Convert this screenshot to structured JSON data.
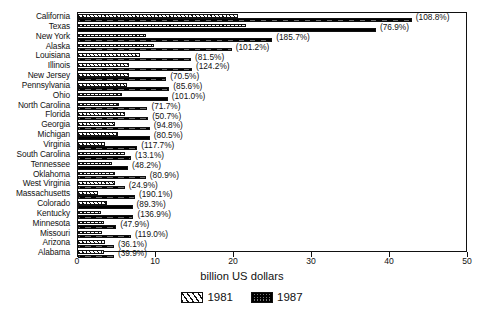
{
  "chart_data": {
    "type": "bar",
    "orientation": "horizontal",
    "title": "",
    "xlabel": "billion US dollars",
    "ylabel": "",
    "xlim": [
      0,
      50
    ],
    "xticks": [
      0,
      10,
      20,
      30,
      40,
      50
    ],
    "xtick_labels": [
      "0",
      "10",
      "20",
      "30",
      "40",
      "50"
    ],
    "grid": false,
    "legend_position": "bottom-center",
    "categories": [
      "California",
      "Texas",
      "New York",
      "Alaska",
      "Louisiana",
      "Illinois",
      "New Jersey",
      "Pennsylvania",
      "Ohio",
      "North Carolina",
      "Florida",
      "Georgia",
      "Michigan",
      "Virginia",
      "South Carolina",
      "Tennessee",
      "Oklahoma",
      "West Virginia",
      "Massachusetts",
      "Colorado",
      "Kentucky",
      "Minnesota",
      "Missouri",
      "Arizona",
      "Alabama"
    ],
    "series": [
      {
        "name": "1981",
        "values": [
          20.5,
          21.6,
          8.7,
          9.8,
          8.0,
          6.5,
          6.6,
          6.3,
          5.7,
          5.2,
          6.0,
          4.7,
          5.1,
          3.5,
          6.0,
          4.3,
          4.8,
          4.8,
          2.5,
          3.7,
          3.0,
          3.3,
          3.1,
          3.4,
          3.3
        ]
      },
      {
        "name": "1987",
        "values": [
          42.8,
          38.2,
          24.9,
          19.7,
          14.5,
          14.6,
          11.3,
          11.7,
          11.5,
          8.9,
          9.0,
          9.2,
          9.2,
          7.6,
          6.8,
          6.4,
          8.7,
          6.0,
          7.3,
          7.0,
          7.1,
          4.9,
          6.8,
          4.6,
          4.6
        ]
      }
    ],
    "point_labels": [
      "(108.8%)",
      "(76.9%)",
      "(185.7%)",
      "(101.2%)",
      "(81.5%)",
      "(124.2%)",
      "(70.5%)",
      "(85.6%)",
      "(101.0%)",
      "(71.7%)",
      "(50.7%)",
      "(94.8%)",
      "(80.5%)",
      "(117.7%)",
      "(13.1%)",
      "(48.2%)",
      "(80.9%)",
      "(24.9%)",
      "(190.1%)",
      "(89.3%)",
      "(136.9%)",
      "(47.9%)",
      "(119.0%)",
      "(36.1%)",
      "(39.9%)"
    ],
    "legend": [
      {
        "label": "1981",
        "pattern": "diagonal-hatch",
        "color": "#ffffff"
      },
      {
        "label": "1987",
        "pattern": "dark-stipple",
        "color": "#3a3a3a"
      }
    ]
  }
}
